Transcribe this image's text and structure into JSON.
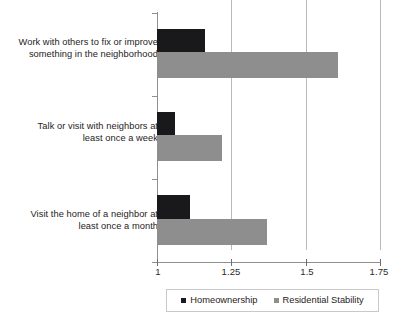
{
  "chart_data": {
    "type": "bar",
    "orientation": "horizontal",
    "title": "",
    "subtitle": "",
    "xlabel": "",
    "ylabel": "",
    "xlim": [
      1,
      1.75
    ],
    "x_ticks": [
      "1",
      "1.25",
      "1.5",
      "1.75"
    ],
    "x_tick_values": [
      1,
      1.25,
      1.5,
      1.75
    ],
    "grid": "vertical gridlines at 1.25, 1.5, 1.75",
    "legend_position": "bottom-center",
    "categories": [
      "Work with others to fix or improve something in the neighborhood",
      "Talk or visit with neighbors at least once a week",
      "Visit the home of a neighbor at least once a month"
    ],
    "category_labels": [
      {
        "line1": "Work with others to fix or improve",
        "line2": "something in the neighborhood"
      },
      {
        "line1": "Talk or visit with neighbors at",
        "line2": "least once a week"
      },
      {
        "line1": "Visit the home of a neighbor at",
        "line2": "least once a month"
      }
    ],
    "series": [
      {
        "name": "Homeownership",
        "color": "#19181a",
        "values": [
          1.16,
          1.06,
          1.11
        ]
      },
      {
        "name": "Residential Stability",
        "color": "#8e8e8e",
        "values": [
          1.61,
          1.22,
          1.37
        ]
      }
    ],
    "legend": [
      {
        "label": "Homeownership",
        "color": "#19181a"
      },
      {
        "label": "Residential Stability",
        "color": "#8e8e8e"
      }
    ]
  },
  "colors": {
    "background": "#ffffff",
    "axis": "#8f8f8f",
    "gridline": "#b9b9b9",
    "text": "#262224",
    "homeownership": "#19181a",
    "residential_stability": "#8e8e8e"
  }
}
